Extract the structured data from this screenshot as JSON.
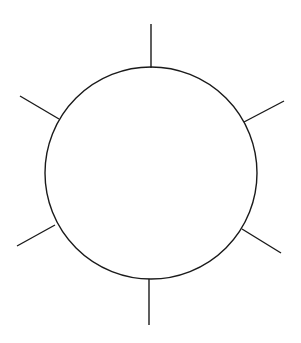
{
  "diagram": {
    "type": "circle-with-radial-spokes",
    "background": "#ffffff",
    "stroke_color": "#1a1a1a",
    "stroke_width": 1.4,
    "circle": {
      "cx": 151,
      "cy": 173,
      "r": 106
    },
    "spokes": [
      {
        "name": "top",
        "x1": 151,
        "y1": 68,
        "x2": 151,
        "y2": 24
      },
      {
        "name": "upper-right",
        "x1": 244,
        "y1": 122,
        "x2": 284,
        "y2": 101
      },
      {
        "name": "lower-right",
        "x1": 242,
        "y1": 229,
        "x2": 281,
        "y2": 253
      },
      {
        "name": "bottom",
        "x1": 149,
        "y1": 279,
        "x2": 149,
        "y2": 325
      },
      {
        "name": "lower-left",
        "x1": 55,
        "y1": 225,
        "x2": 17,
        "y2": 246
      },
      {
        "name": "upper-left",
        "x1": 59,
        "y1": 119,
        "x2": 20,
        "y2": 96
      }
    ]
  }
}
